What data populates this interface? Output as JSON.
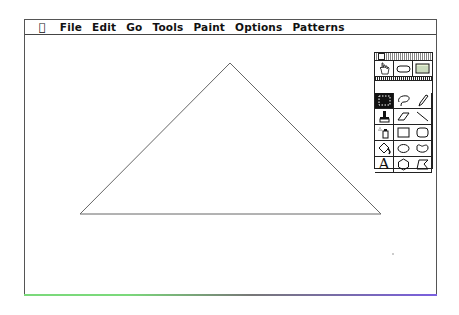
{
  "menubar": {
    "apple_icon": "apple-icon",
    "items": [
      "File",
      "Edit",
      "Go",
      "Tools",
      "Paint",
      "Options",
      "Patterns"
    ]
  },
  "canvas": {
    "shape": "triangle",
    "vertices": [
      [
        230,
        62
      ],
      [
        80,
        213
      ],
      [
        381,
        213
      ]
    ],
    "stroke_color": "#666666"
  },
  "tool_palette": {
    "tools": [
      {
        "name": "browse-hand",
        "icon": "hand-icon"
      },
      {
        "name": "button",
        "icon": "button-icon"
      },
      {
        "name": "field",
        "icon": "field-icon"
      },
      {
        "name": "select",
        "icon": "select-rect-icon",
        "active": true
      },
      {
        "name": "lasso",
        "icon": "lasso-icon"
      },
      {
        "name": "pencil",
        "icon": "pencil-icon"
      },
      {
        "name": "brush",
        "icon": "brush-icon"
      },
      {
        "name": "eraser",
        "icon": "eraser-icon"
      },
      {
        "name": "line",
        "icon": "line-icon"
      },
      {
        "name": "spray",
        "icon": "spray-can-icon"
      },
      {
        "name": "rectangle",
        "icon": "rectangle-icon"
      },
      {
        "name": "round-rect",
        "icon": "round-rect-icon"
      },
      {
        "name": "bucket",
        "icon": "paint-bucket-icon"
      },
      {
        "name": "oval",
        "icon": "oval-icon"
      },
      {
        "name": "curve",
        "icon": "curve-icon"
      },
      {
        "name": "text",
        "icon": "text-icon",
        "glyph": "A"
      },
      {
        "name": "regular-polygon",
        "icon": "hexagon-icon"
      },
      {
        "name": "polygon",
        "icon": "polygon-icon"
      }
    ]
  },
  "colors": {
    "frame_border": "#555555",
    "bottom_edge_left": "#7bd97b",
    "bottom_edge_right": "#7a5fe0"
  }
}
